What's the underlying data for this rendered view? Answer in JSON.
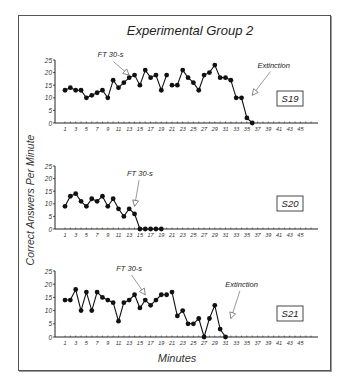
{
  "chart_data": {
    "type": "line",
    "title": "Experimental Group 2",
    "xlabel": "Minutes",
    "ylabel": "Correct Answers Per Minute",
    "ylim": [
      0,
      25
    ],
    "yticks": [
      0,
      5,
      10,
      15,
      20,
      25
    ],
    "xticks": [
      1,
      3,
      5,
      7,
      9,
      11,
      13,
      15,
      17,
      19,
      21,
      23,
      25,
      27,
      29,
      31,
      33,
      35,
      37,
      39,
      41,
      43,
      45
    ],
    "xlim": [
      0,
      47
    ],
    "grid": false,
    "panels": [
      {
        "id": "S19",
        "label": "S19",
        "segments": [
          {
            "x": [
              1,
              2,
              3,
              4,
              5,
              6,
              7,
              8,
              9,
              10,
              11,
              12,
              13,
              14,
              15,
              16,
              17,
              18,
              19,
              20
            ],
            "y": [
              13,
              14,
              13,
              13,
              10,
              11,
              12,
              13,
              10,
              17,
              14,
              16,
              18,
              19,
              15,
              21,
              18,
              19,
              13,
              19
            ]
          },
          {
            "x": [
              21,
              22,
              23,
              24,
              25,
              26,
              27,
              28,
              29,
              30,
              31,
              32,
              33,
              34,
              35,
              36
            ],
            "y": [
              15,
              15,
              21,
              18,
              16,
              13,
              19,
              20,
              23,
              18,
              18,
              17,
              10,
              10,
              2,
              0
            ]
          }
        ],
        "annotations": [
          {
            "text": "FT 30-s",
            "x": 13,
            "y": 19,
            "tx": 9.5,
            "ty": 26
          },
          {
            "text": "Extinction",
            "x": 36,
            "y": 11,
            "tx": 40,
            "ty": 22
          }
        ]
      },
      {
        "id": "S20",
        "label": "S20",
        "segments": [
          {
            "x": [
              1,
              2,
              3,
              4,
              5,
              6,
              7,
              8,
              9,
              10,
              11,
              12,
              13,
              14,
              15,
              16,
              17,
              18,
              19
            ],
            "y": [
              9,
              13,
              14,
              11,
              9,
              12,
              11,
              13,
              9,
              12,
              8,
              5,
              8,
              6,
              0,
              0,
              0,
              0,
              0
            ]
          }
        ],
        "annotations": [
          {
            "text": "FT 30-s",
            "x": 14,
            "y": 9,
            "tx": 15,
            "ty": 21
          }
        ]
      },
      {
        "id": "S21",
        "label": "S21",
        "segments": [
          {
            "x": [
              1,
              2,
              3,
              4,
              5,
              6,
              7,
              8,
              9,
              10,
              11,
              12,
              13,
              14,
              15,
              16,
              17,
              18,
              19,
              20
            ],
            "y": [
              14,
              14,
              18,
              10,
              17,
              10,
              17,
              15,
              14,
              13,
              6,
              13,
              14,
              16,
              11,
              14,
              12,
              14,
              16,
              16
            ]
          },
          {
            "x": [
              21,
              22,
              23,
              24,
              25,
              26,
              27,
              28,
              29,
              30,
              31
            ],
            "y": [
              17,
              8,
              10,
              5,
              5,
              7,
              0,
              7,
              12,
              3,
              0
            ]
          }
        ],
        "annotations": [
          {
            "text": "FT 30-s",
            "x": 16,
            "y": 16,
            "tx": 13,
            "ty": 25
          },
          {
            "text": "Extinction",
            "x": 32,
            "y": 7,
            "tx": 34,
            "ty": 19
          }
        ]
      }
    ]
  }
}
